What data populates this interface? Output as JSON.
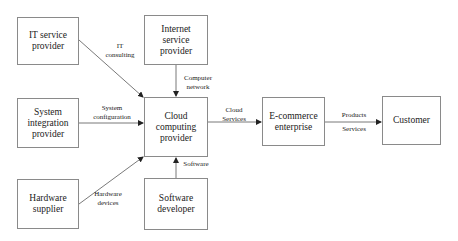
{
  "nodes": {
    "it_service_provider": "IT service\nprovider",
    "internet_service_provider": "Internet\nservice\nprovider",
    "system_integration_provider": "System\nintegration\nprovider",
    "cloud_computing_provider": "Cloud computing\nprovider",
    "hardware_supplier": "Hardware\nsupplier",
    "software_developer": "Software\ndeveloper",
    "ecommerce_enterprise": "E-commerce\nenterprise",
    "customer": "Customer"
  },
  "edges": {
    "it_consulting": "IT\nconsulting",
    "computer_network": "Computer\nnetwork",
    "system_configuration": "System\nconfiguration",
    "hardware_devices": "Hardware\ndevices",
    "software": "Software",
    "cloud_services": "Cloud\nServices",
    "products": "Products",
    "services": "Services"
  }
}
